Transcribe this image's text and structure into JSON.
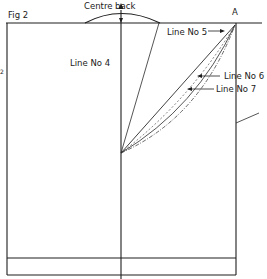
{
  "figure": {
    "label": "Fig 2",
    "type": "pattern drafting diagram",
    "colors": {
      "line": "#1e1e1e",
      "background": "#ffffff"
    }
  },
  "labels": {
    "centre_back": "Centre back",
    "point_a": "A",
    "line_4": "Line No 4",
    "line_5": "Line No 5",
    "line_6": "Line No 6",
    "line_7": "Line No 7",
    "edge_mark": "2"
  }
}
